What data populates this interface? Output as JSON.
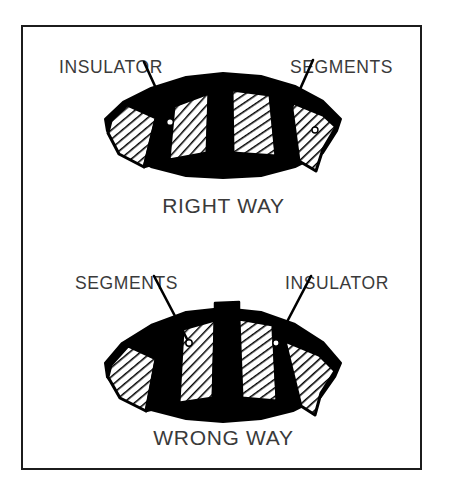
{
  "figure": {
    "border_color": "#1c1c1c",
    "background_color": "#ffffff",
    "ink_color": "#000000",
    "text_color": "#3a3a3a"
  },
  "panels": [
    {
      "id": "right-way",
      "caption": "RIGHT WAY",
      "labels": [
        {
          "text": "INSULATOR",
          "position": "top-left",
          "points_to": "insulator"
        },
        {
          "text": "SEGMENTS",
          "position": "top-right",
          "points_to": "segment"
        }
      ],
      "diagram": {
        "type": "commutator-arc",
        "segment_count": 4,
        "insulator_count": 3,
        "insulator_state": "flush",
        "segment_fill": "diagonal-hatch",
        "insulator_fill": "solid-black",
        "description": "Insulator mica undercut flush with segment surface"
      }
    },
    {
      "id": "wrong-way",
      "caption": "WRONG WAY",
      "labels": [
        {
          "text": "SEGMENTS",
          "position": "top-left",
          "points_to": "segment"
        },
        {
          "text": "INSULATOR",
          "position": "top-right",
          "points_to": "insulator"
        }
      ],
      "diagram": {
        "type": "commutator-arc",
        "segment_count": 4,
        "insulator_count": 3,
        "insulator_state": "protruding",
        "segment_fill": "diagonal-hatch",
        "insulator_fill": "solid-black",
        "description": "Insulator mica standing proud above segment surface"
      }
    }
  ]
}
